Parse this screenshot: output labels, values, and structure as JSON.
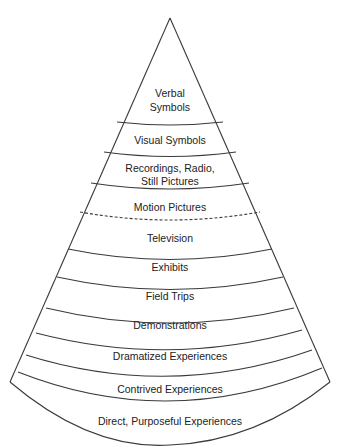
{
  "diagram": {
    "type": "cone-of-experience",
    "colors": {
      "stroke": "#3a3a3a",
      "text": "#222222",
      "background": "#ffffff"
    },
    "levels": [
      {
        "id": "verbal-symbols",
        "lines": [
          "Verbal",
          "Symbols"
        ]
      },
      {
        "id": "visual-symbols",
        "lines": [
          "Visual Symbols"
        ]
      },
      {
        "id": "recordings-radio-still-pictures",
        "lines": [
          "Recordings, Radio,",
          "Still Pictures"
        ]
      },
      {
        "id": "motion-pictures",
        "lines": [
          "Motion Pictures"
        ]
      },
      {
        "id": "television",
        "lines": [
          "Television"
        ]
      },
      {
        "id": "exhibits",
        "lines": [
          "Exhibits"
        ]
      },
      {
        "id": "field-trips",
        "lines": [
          "Field Trips"
        ]
      },
      {
        "id": "demonstrations",
        "lines": [
          "Demonstrations"
        ]
      },
      {
        "id": "dramatized-experiences",
        "lines": [
          "Dramatized Experiences"
        ]
      },
      {
        "id": "contrived-experiences",
        "lines": [
          "Contrived Experiences"
        ]
      },
      {
        "id": "direct-purposeful-experiences",
        "lines": [
          "Direct, Purposeful Experiences"
        ]
      }
    ],
    "dashed_boundary_between": [
      "Motion Pictures",
      "Television"
    ]
  }
}
